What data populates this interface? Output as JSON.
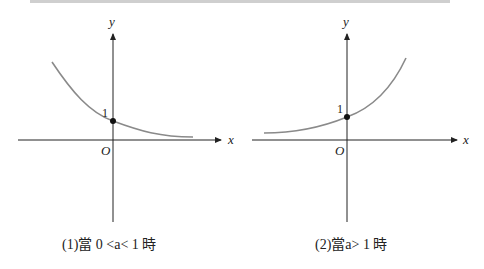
{
  "panels": [
    {
      "axis_x_label": "x",
      "axis_y_label": "y",
      "origin_label": "O",
      "intercept_label": "1",
      "caption": "(1)當 0 <a< 1 時",
      "curve": "decreasing exponential"
    },
    {
      "axis_x_label": "x",
      "axis_y_label": "y",
      "origin_label": "O",
      "intercept_label": "1",
      "caption": "(2)當a> 1 時",
      "curve": "increasing exponential"
    }
  ],
  "colors": {
    "axis": "#222222",
    "curve": "#8a8a8a",
    "point": "#111111"
  }
}
